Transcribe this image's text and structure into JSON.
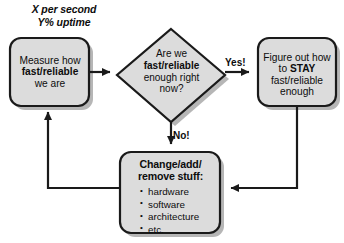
{
  "diagram": {
    "title_annotation": {
      "line1": "X per second",
      "line2": "Y% uptime"
    },
    "nodes": {
      "measure": {
        "shape": "rounded-rectangle",
        "line1": "Measure how",
        "line2": "fast/reliable",
        "line3": "we are"
      },
      "decision": {
        "shape": "diamond",
        "line1": "Are we",
        "line2": "fast/reliable",
        "line3": "enough right",
        "line4": "now?"
      },
      "stay": {
        "shape": "rounded-rectangle",
        "line1": "Figure out how",
        "line2_prefix": "to ",
        "line2_bold": "STAY",
        "line3": "fast/reliable",
        "line4": "enough"
      },
      "change": {
        "shape": "rounded-rectangle",
        "title_line1": "Change/add/",
        "title_line2": "remove stuff:",
        "bullets": [
          "hardware",
          "software",
          "architecture",
          "etc."
        ]
      }
    },
    "edges": [
      {
        "name": "measure-to-decision",
        "label": ""
      },
      {
        "name": "decision-to-stay",
        "label": "Yes!"
      },
      {
        "name": "decision-to-change",
        "label": "No!"
      },
      {
        "name": "stay-to-change",
        "label": ""
      },
      {
        "name": "change-to-measure",
        "label": ""
      }
    ],
    "labels": {
      "yes": "Yes!",
      "no": "No!"
    },
    "colors": {
      "background": "#ffffff",
      "node_fill": "#dcdcdc",
      "node_stroke": "#1a1a1a",
      "shadow": "#9a9a9a",
      "text": "#0d0d0d",
      "connector": "#1a1a1a"
    }
  }
}
